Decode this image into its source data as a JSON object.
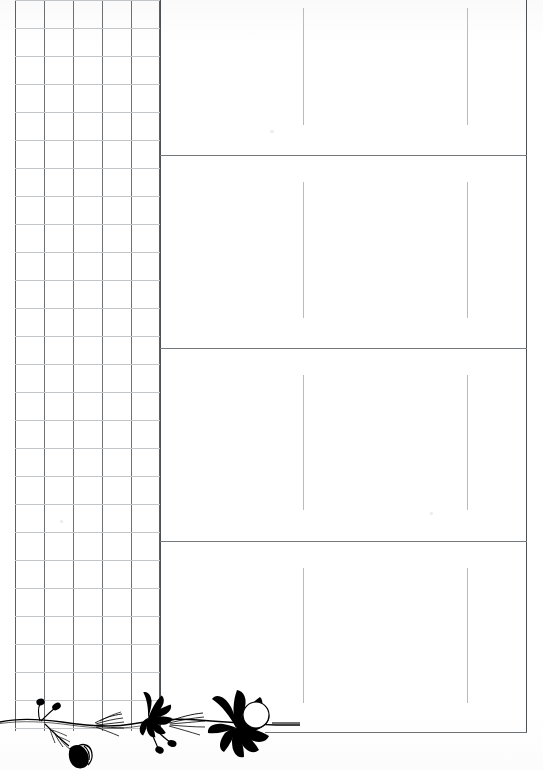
{
  "page": {
    "width": 543,
    "height": 770,
    "background_color": "#ffffff",
    "ink_color": "#000000",
    "grid_line_color": "#6e7174",
    "faint_line_color": "#c3c6c9",
    "divider_color": "#4d5154"
  },
  "left_grid": {
    "label": "Grid area",
    "x": 15,
    "y": 0,
    "width": 145,
    "height": 731,
    "column_count": 5,
    "row_count": 26,
    "cell_size_px": 29,
    "column_positions": [
      0,
      29,
      58,
      87,
      116,
      145
    ],
    "row_spacing_px": 28
  },
  "right_panel": {
    "label": "Lined writing sections",
    "x": 160,
    "y": 0,
    "width": 367,
    "height": 733,
    "section_dividers_y": [
      155,
      348,
      541,
      733
    ],
    "sections": [
      {
        "name": "section-1",
        "top": 0,
        "bottom": 155,
        "guide_top": 8,
        "guide_bottom": 125
      },
      {
        "name": "section-2",
        "top": 155,
        "bottom": 348,
        "guide_top": 182,
        "guide_bottom": 318
      },
      {
        "name": "section-3",
        "top": 348,
        "bottom": 541,
        "guide_top": 375,
        "guide_bottom": 510
      },
      {
        "name": "section-4",
        "top": 541,
        "bottom": 733,
        "guide_top": 568,
        "guide_bottom": 703
      }
    ],
    "guide_line_x": [
      143,
      307
    ],
    "guide_line_color": "#b9bcbf"
  },
  "ornament": {
    "name": "botanical-floral-sprig",
    "description": "Black silhouette flowering stem with two fan-shaped blooms, seed-head buds, feathery leaves and a white circular seed pod",
    "x": 0,
    "y": 660,
    "width": 300,
    "height": 110,
    "fill": "#000000",
    "elements": [
      "main-stem",
      "large-fan-flower",
      "small-fan-flower",
      "seed-pod-circle",
      "bud-left-tall",
      "bud-left-short",
      "bud-right-pair",
      "feather-leaf-left",
      "feather-leaf-mid",
      "leaf-cluster-bottom"
    ]
  }
}
